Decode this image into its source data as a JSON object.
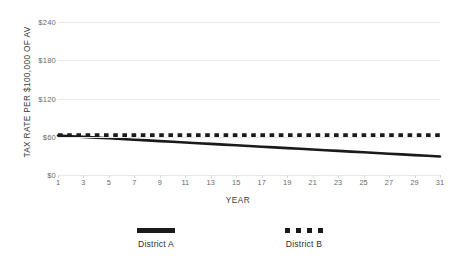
{
  "chart_data": {
    "type": "line",
    "title": "",
    "xlabel": "YEAR",
    "ylabel": "TAX RATE PER $100,000 OF AV",
    "xlim": [
      1,
      31
    ],
    "ylim": [
      0,
      240
    ],
    "grid": true,
    "grid_color": "#e9e9ea",
    "background": "#ffffff",
    "legend_position": "bottom",
    "y_ticks": [
      {
        "value": 240,
        "label": "$240"
      },
      {
        "value": 180,
        "label": "$180"
      },
      {
        "value": 120,
        "label": "$120"
      },
      {
        "value": 60,
        "label": "$60"
      },
      {
        "value": 0,
        "label": "$0"
      }
    ],
    "x_ticks": [
      {
        "value": 1,
        "label": "1"
      },
      {
        "value": 3,
        "label": "3"
      },
      {
        "value": 5,
        "label": "5"
      },
      {
        "value": 7,
        "label": "7"
      },
      {
        "value": 9,
        "label": "9"
      },
      {
        "value": 11,
        "label": "11"
      },
      {
        "value": 13,
        "label": "13"
      },
      {
        "value": 15,
        "label": "15"
      },
      {
        "value": 17,
        "label": "17"
      },
      {
        "value": 19,
        "label": "19"
      },
      {
        "value": 21,
        "label": "21"
      },
      {
        "value": 23,
        "label": "23"
      },
      {
        "value": 25,
        "label": "25"
      },
      {
        "value": 27,
        "label": "27"
      },
      {
        "value": 29,
        "label": "29"
      },
      {
        "value": 31,
        "label": "31"
      }
    ],
    "x": [
      1,
      2,
      3,
      4,
      5,
      6,
      7,
      8,
      9,
      10,
      11,
      12,
      13,
      14,
      15,
      16,
      17,
      18,
      19,
      20,
      21,
      22,
      23,
      24,
      25,
      26,
      27,
      28,
      29,
      30,
      31
    ],
    "series": [
      {
        "name": "District A",
        "style": "solid",
        "color": "#1a1a1a",
        "width": 2.6,
        "values": [
          62,
          60.9,
          59.8,
          58.7,
          57.6,
          56.5,
          55.4,
          54.3,
          53.2,
          52.1,
          51,
          49.9,
          48.8,
          47.7,
          46.6,
          45.5,
          44.4,
          43.3,
          42.2,
          41.1,
          40,
          38.9,
          37.8,
          36.7,
          35.6,
          34.5,
          33.4,
          32.3,
          31.2,
          30.1,
          29
        ]
      },
      {
        "name": "District B",
        "style": "dashed",
        "color": "#1a1a1a",
        "width": 4.2,
        "values": [
          62,
          62,
          62,
          62,
          62,
          62,
          62,
          62,
          62,
          62,
          62,
          62,
          62,
          62,
          62,
          62,
          62,
          62,
          62,
          62,
          62,
          62,
          62,
          62,
          62,
          62,
          62,
          62,
          62,
          62,
          62
        ]
      }
    ]
  },
  "legend": {
    "entries": [
      {
        "label": "District A",
        "style": "solid"
      },
      {
        "label": "District B",
        "style": "dashed"
      }
    ]
  }
}
